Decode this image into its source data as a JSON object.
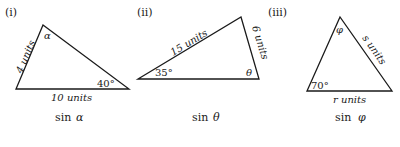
{
  "figures": [
    {
      "number": "(i)",
      "side_a": "4 units",
      "side_b": "10 units",
      "angle_known": "40°",
      "angle_unknown": "α",
      "caption_func": "sin",
      "caption_var": "α"
    },
    {
      "number": "(ii)",
      "side_a": "15 units",
      "side_b": "6 units",
      "angle_known": "35°",
      "angle_unknown": "θ",
      "caption_func": "sin",
      "caption_var": "θ"
    },
    {
      "number": "(iii)",
      "side_a": "s units",
      "side_b": "r units",
      "angle_known": "70°",
      "angle_unknown": "φ",
      "caption_func": "sin",
      "caption_var": "φ"
    }
  ],
  "colors": {
    "line": "#1a1a1a",
    "background": "#ffffff"
  }
}
